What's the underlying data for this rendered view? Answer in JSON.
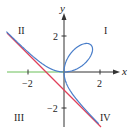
{
  "figure": {
    "axes": {
      "x_label": "x",
      "y_label": "y",
      "x_ticks": [
        {
          "value": -2,
          "label": "−2"
        },
        {
          "value": 2,
          "label": "2"
        }
      ],
      "y_ticks": [
        {
          "value": 2,
          "label": "2"
        },
        {
          "value": -2,
          "label": "−2"
        }
      ]
    },
    "quadrants": {
      "I": "I",
      "II": "II",
      "III": "III",
      "IV": "IV"
    },
    "curves": [
      {
        "name": "folium",
        "equation": "x^3 + y^3 = 3xy",
        "color": "#4a7ec9"
      },
      {
        "name": "asymptote",
        "equation": "x + y = -1",
        "color": "#e0405a"
      }
    ],
    "colors": {
      "axis": "#333333",
      "negative_x_axis": "#6bbf59",
      "curve": "#4a7ec9",
      "asymptote": "#e0405a"
    }
  }
}
